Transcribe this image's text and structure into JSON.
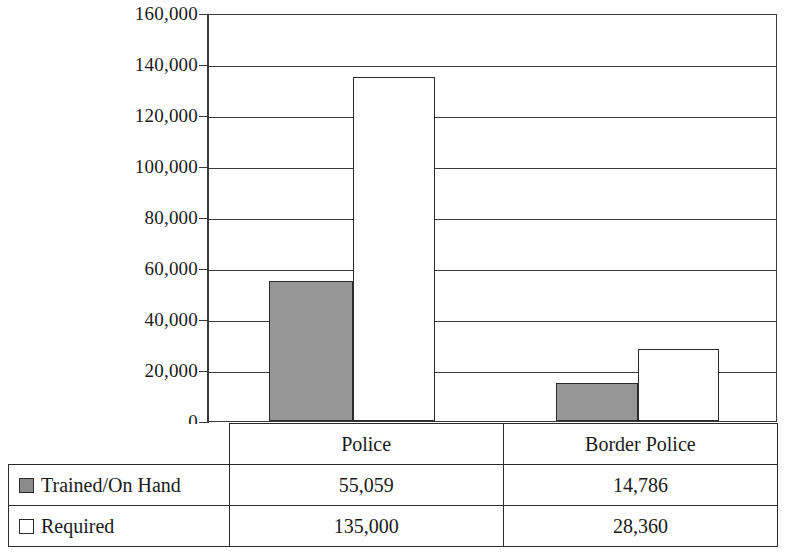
{
  "chart_data": {
    "type": "bar",
    "title": "",
    "xlabel": "",
    "ylabel": "",
    "categories": [
      "Police",
      "Border Police"
    ],
    "series": [
      {
        "name": "Trained/On Hand",
        "values": [
          55059,
          135000
        ],
        "swatch": "filled",
        "color": "#969696"
      },
      {
        "name": "Required",
        "values": [
          135000,
          28360
        ],
        "swatch": "hollow",
        "color": "#ffffff"
      }
    ],
    "series_by_category": {
      "Police": {
        "Trained/On Hand": 55059,
        "Required": 135000
      },
      "Border Police": {
        "Trained/On Hand": 14786,
        "Required": 28360
      }
    },
    "ylim": [
      0,
      160000
    ],
    "ytick_step": 20000,
    "ytick_labels": [
      "0",
      "20,000",
      "40,000",
      "60,000",
      "80,000",
      "100,000",
      "120,000",
      "140,000",
      "160,000"
    ],
    "ytick_values": [
      0,
      20000,
      40000,
      60000,
      80000,
      100000,
      120000,
      140000,
      160000
    ],
    "grid": true,
    "legend_position": "table-below"
  },
  "bars": [
    {
      "id": "police-trained",
      "category": "Police",
      "series": "Trained/On Hand",
      "value": 55059,
      "value_label": "55,059",
      "style": "series-trained",
      "left": 60,
      "width": 84
    },
    {
      "id": "police-required",
      "category": "Police",
      "series": "Required",
      "value": 135000,
      "value_label": "135,000",
      "style": "series-required",
      "left": 144,
      "width": 82
    },
    {
      "id": "border-police-trained",
      "category": "Border Police",
      "series": "Trained/On Hand",
      "value": 14786,
      "value_label": "14,786",
      "style": "series-trained",
      "left": 347,
      "width": 82
    },
    {
      "id": "border-police-required",
      "category": "Border Police",
      "series": "Required",
      "value": 28360,
      "value_label": "28,360",
      "style": "series-required",
      "left": 429,
      "width": 81
    }
  ],
  "table": {
    "header_row": {
      "corner": "",
      "cells": [
        "Police",
        "Border Police"
      ]
    },
    "rows": [
      {
        "swatch": "filled",
        "label": "Trained/On Hand",
        "values": [
          "55,059",
          "14,786"
        ]
      },
      {
        "swatch": "hollow",
        "label": "Required",
        "values": [
          "135,000",
          "28,360"
        ]
      }
    ]
  },
  "colors": {
    "trained_fill": "#969696",
    "required_fill": "#ffffff",
    "outline": "#2b2b2b",
    "grid": "#3a3a3a",
    "background": "#ffffff"
  }
}
